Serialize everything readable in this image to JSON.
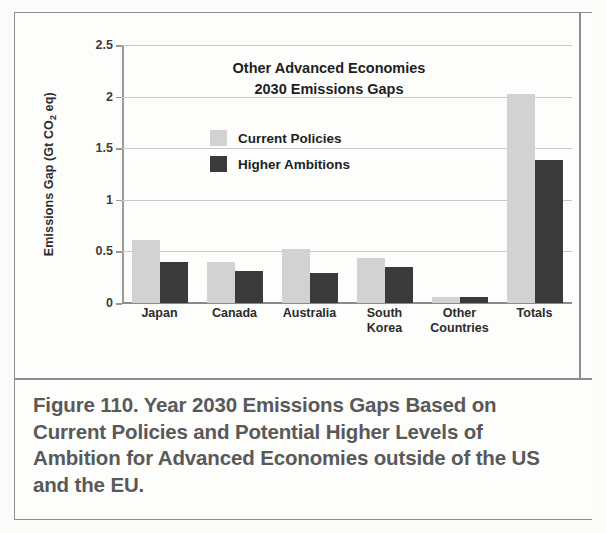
{
  "figure": {
    "caption": "Figure 110. Year 2030 Emissions Gaps Based on Current Policies and Potential Higher Levels of Ambition for Advanced Economies outside of the US and the EU."
  },
  "colors": {
    "current_policies": "#d2d2d2",
    "higher_ambitions": "#3a3a3a",
    "gridline": "#c8c8c8",
    "axis": "#8a8a8a",
    "caption_text": "#595959",
    "frame": "#8e8e8e"
  },
  "axis": {
    "y_label_prefix": "Emissions Gap (Gt CO",
    "y_label_sub": "2",
    "y_label_suffix": " eq)"
  },
  "chart_data": {
    "type": "bar",
    "title": "Other Advanced Economies\n2030 Emissions Gaps",
    "title_line1": "Other Advanced Economies",
    "title_line2": "2030 Emissions Gaps",
    "xlabel": "",
    "ylabel": "Emissions Gap (Gt CO2 eq)",
    "ylim": [
      0,
      2.5
    ],
    "ytick_labels": [
      "0",
      "0.5",
      "1",
      "1.5",
      "2",
      "2.5"
    ],
    "ytick_values": [
      0,
      0.5,
      1,
      1.5,
      2,
      2.5
    ],
    "grid": true,
    "legend_position": "inside-upper-left",
    "categories": [
      "Japan",
      "Canada",
      "Australia",
      "South Korea",
      "Other Countries",
      "Totals"
    ],
    "category_lines": [
      [
        "Japan"
      ],
      [
        "Canada"
      ],
      [
        "Australia"
      ],
      [
        "South",
        "Korea"
      ],
      [
        "Other",
        "Countries"
      ],
      [
        "Totals"
      ]
    ],
    "series": [
      {
        "name": "Current Policies",
        "color": "#d2d2d2",
        "values": [
          0.61,
          0.4,
          0.52,
          0.44,
          0.06,
          2.03
        ]
      },
      {
        "name": "Higher Ambitions",
        "color": "#3a3a3a",
        "values": [
          0.4,
          0.31,
          0.29,
          0.35,
          0.06,
          1.39
        ]
      }
    ]
  }
}
